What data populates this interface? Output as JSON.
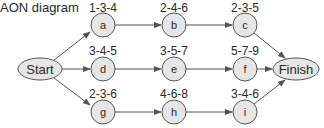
{
  "title": "AON diagram",
  "colors": {
    "node_fill": "#e6e6e6",
    "stroke": "#555555",
    "text": "#2a2a2a"
  },
  "start": {
    "label": "Start"
  },
  "finish": {
    "label": "Finish"
  },
  "nodes": [
    {
      "id": "a",
      "times": "1-3-4"
    },
    {
      "id": "b",
      "times": "2-4-6"
    },
    {
      "id": "c",
      "times": "2-3-5"
    },
    {
      "id": "d",
      "times": "3-4-5"
    },
    {
      "id": "e",
      "times": "3-5-7"
    },
    {
      "id": "f",
      "times": "5-7-9"
    },
    {
      "id": "g",
      "times": "2-3-6"
    },
    {
      "id": "h",
      "times": "4-6-8"
    },
    {
      "id": "i",
      "times": "3-4-6"
    }
  ],
  "edges": [
    [
      "Start",
      "a"
    ],
    [
      "Start",
      "d"
    ],
    [
      "Start",
      "g"
    ],
    [
      "a",
      "b"
    ],
    [
      "b",
      "c"
    ],
    [
      "c",
      "Finish"
    ],
    [
      "d",
      "e"
    ],
    [
      "e",
      "f"
    ],
    [
      "f",
      "Finish"
    ],
    [
      "g",
      "h"
    ],
    [
      "h",
      "i"
    ],
    [
      "i",
      "Finish"
    ]
  ]
}
